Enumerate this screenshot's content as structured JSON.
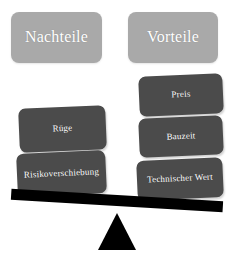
{
  "diagram": {
    "type": "balance-scale-pros-cons",
    "colors": {
      "header_card_background": "#a9a9a9",
      "item_card_background": "#4b4b4b",
      "card_text": "#ffffff",
      "beam": "#000000",
      "fulcrum": "#000000",
      "page_background": "#ffffff"
    },
    "left_side": {
      "header": "Nachteile",
      "items": [
        {
          "label": "Rüge"
        },
        {
          "label": "Risikoverschiebung"
        }
      ]
    },
    "right_side": {
      "header": "Vorteile",
      "items": [
        {
          "label": "Preis"
        },
        {
          "label": "Bauzeit"
        },
        {
          "label": "Technischer Wert"
        }
      ]
    },
    "scale": {
      "beam_name": "seesaw-beam",
      "fulcrum_name": "seesaw-fulcrum",
      "tilt_direction": "right-side-down",
      "tilt_degrees": 3.4
    }
  }
}
